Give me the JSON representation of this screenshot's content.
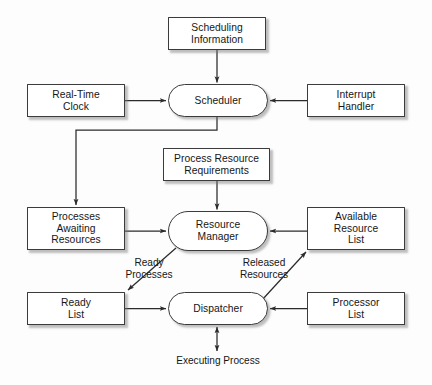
{
  "diagram": {
    "background_color": "#fdfdfd",
    "node_fill": "#ffffff",
    "node_border_color": "#3b3b3b",
    "line_color": "#2b2b2b",
    "text_color": "#161616",
    "nodes": [
      {
        "id": "scheduling_information",
        "label": "Scheduling\nInformation",
        "shape": "rect",
        "x": 168,
        "y": 17,
        "w": 98,
        "h": 33
      },
      {
        "id": "real_time_clock",
        "label": "Real-Time\nClock",
        "shape": "rect",
        "x": 27,
        "y": 84,
        "w": 98,
        "h": 33
      },
      {
        "id": "scheduler",
        "label": "Scheduler",
        "shape": "pill",
        "x": 168,
        "y": 84,
        "w": 100,
        "h": 33
      },
      {
        "id": "interrupt_handler",
        "label": "Interrupt\nHandler",
        "shape": "rect",
        "x": 307,
        "y": 84,
        "w": 98,
        "h": 33
      },
      {
        "id": "process_resource_requirements",
        "label": "Process Resource\nRequirements",
        "shape": "rect",
        "x": 163,
        "y": 148,
        "w": 107,
        "h": 33
      },
      {
        "id": "processes_awaiting_resources",
        "label": "Processes\nAwaiting\nResources",
        "shape": "rect",
        "x": 27,
        "y": 207,
        "w": 98,
        "h": 43
      },
      {
        "id": "resource_manager",
        "label": "Resource\nManager",
        "shape": "pill",
        "x": 168,
        "y": 211,
        "w": 100,
        "h": 40
      },
      {
        "id": "available_resource_list",
        "label": "Available\nResource\nList",
        "shape": "rect",
        "x": 307,
        "y": 207,
        "w": 98,
        "h": 43
      },
      {
        "id": "ready_list",
        "label": "Ready\nList",
        "shape": "rect",
        "x": 27,
        "y": 292,
        "w": 98,
        "h": 33
      },
      {
        "id": "dispatcher",
        "label": "Dispatcher",
        "shape": "pill",
        "x": 168,
        "y": 292,
        "w": 100,
        "h": 33
      },
      {
        "id": "processor_list",
        "label": "Processor\nList",
        "shape": "rect",
        "x": 307,
        "y": 292,
        "w": 98,
        "h": 33
      }
    ],
    "edge_labels": [
      {
        "id": "ready_processes",
        "label": "Ready\nProcesses",
        "x": 148,
        "y": 257
      },
      {
        "id": "released_resources",
        "label": "Released\nResources",
        "x": 228,
        "y": 257
      },
      {
        "id": "executing_process",
        "label": "Executing Process",
        "x": 167,
        "y": 362
      }
    ],
    "edges": [
      {
        "id": "scheduling-information-to-scheduler",
        "from": "scheduling_information",
        "to": "scheduler",
        "kind": "straight-vertical",
        "arrowheads": 1
      },
      {
        "id": "real-time-clock-to-scheduler",
        "from": "real_time_clock",
        "to": "scheduler",
        "kind": "straight-horizontal",
        "arrowheads": 1
      },
      {
        "id": "interrupt-handler-to-scheduler",
        "from": "interrupt_handler",
        "to": "scheduler",
        "kind": "straight-horizontal",
        "arrowheads": 1
      },
      {
        "id": "scheduler-to-processes-awaiting-resources",
        "from": "scheduler",
        "to": "processes_awaiting_resources",
        "kind": "elbow",
        "arrowheads": 1
      },
      {
        "id": "process-resource-requirements-to-resource-manager",
        "from": "process_resource_requirements",
        "to": "resource_manager",
        "kind": "straight-vertical",
        "arrowheads": 1
      },
      {
        "id": "processes-awaiting-resources-to-resource-manager",
        "from": "processes_awaiting_resources",
        "to": "resource_manager",
        "kind": "straight-horizontal",
        "arrowheads": 1
      },
      {
        "id": "available-resource-list-to-resource-manager",
        "from": "available_resource_list",
        "to": "resource_manager",
        "kind": "straight-horizontal",
        "arrowheads": 1
      },
      {
        "id": "resource-manager-to-ready-list",
        "from": "resource_manager",
        "to": "ready_list",
        "kind": "diagonal",
        "arrowheads": 1
      },
      {
        "id": "ready-list-to-dispatcher",
        "from": "ready_list",
        "to": "dispatcher",
        "kind": "straight-horizontal",
        "arrowheads": 1
      },
      {
        "id": "processor-list-to-dispatcher",
        "from": "processor_list",
        "to": "dispatcher",
        "kind": "straight-horizontal",
        "arrowheads": 1
      },
      {
        "id": "dispatcher-to-available-resource-list",
        "from": "dispatcher",
        "to": "available_resource_list",
        "kind": "diagonal",
        "arrowheads": 1
      },
      {
        "id": "dispatcher-executing-process",
        "from": "dispatcher",
        "to": "executing_process",
        "kind": "straight-vertical",
        "arrowheads": 2
      }
    ]
  }
}
